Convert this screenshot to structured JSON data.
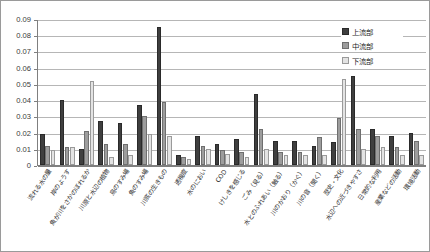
{
  "chart_data": {
    "type": "bar",
    "title": "",
    "xlabel": "",
    "ylabel": "",
    "ylim": [
      0,
      0.09
    ],
    "ytick_labels": [
      "0.09",
      "0.08",
      "0.07",
      "0.06",
      "0.05",
      "0.04",
      "0.03",
      "0.02",
      "0.01",
      "0"
    ],
    "ytick_values": [
      0.09,
      0.08,
      0.07,
      0.06,
      0.05,
      0.04,
      0.03,
      0.02,
      0.01,
      0
    ],
    "grid": true,
    "legend_position": "top-right",
    "categories": [
      "流れる水の量",
      "岸のようす",
      "魚が川をさかのぼれるか",
      "川原と水辺の植物",
      "鳥のすみ場",
      "魚のすみ場",
      "川底の生きもの",
      "透視度",
      "水のにおい",
      "COD",
      "けしきを感じる",
      "ごみ（見る）",
      "水とのふれあい（触る）",
      "川のかおり（かぐ）",
      "川の音（聞く）",
      "歴史・文化",
      "水辺への近づきやすさ",
      "日常的な利用",
      "産業などの活動",
      "環境活動"
    ],
    "series": [
      {
        "name": "上流部",
        "color": "#3f3f3f",
        "values": [
          0.019,
          0.04,
          0.01,
          0.027,
          0.026,
          0.037,
          0.085,
          0.006,
          0.018,
          0.013,
          0.016,
          0.044,
          0.015,
          0.015,
          0.012,
          0.014,
          0.055,
          0.022,
          0.018,
          0.02
        ]
      },
      {
        "name": "中流部",
        "color": "#9d9d9d",
        "values": [
          0.012,
          0.011,
          0.021,
          0.013,
          0.013,
          0.03,
          0.039,
          0.005,
          0.012,
          0.009,
          0.008,
          0.022,
          0.008,
          0.008,
          0.017,
          0.029,
          0.022,
          0.018,
          0.011,
          0.015
        ]
      },
      {
        "name": "下流部",
        "color": "#e3e3e3",
        "values": [
          0.009,
          0.011,
          0.052,
          0.005,
          0.006,
          0.019,
          0.018,
          0.004,
          0.01,
          0.007,
          0.005,
          0.01,
          0.006,
          0.006,
          0.006,
          0.053,
          0.01,
          0.011,
          0.006,
          0.006
        ]
      }
    ]
  },
  "legend": {
    "items": [
      {
        "label": "上流部",
        "series_index": 0
      },
      {
        "label": "中流部",
        "series_index": 1
      },
      {
        "label": "下流部",
        "series_index": 2
      }
    ]
  },
  "caption": ""
}
